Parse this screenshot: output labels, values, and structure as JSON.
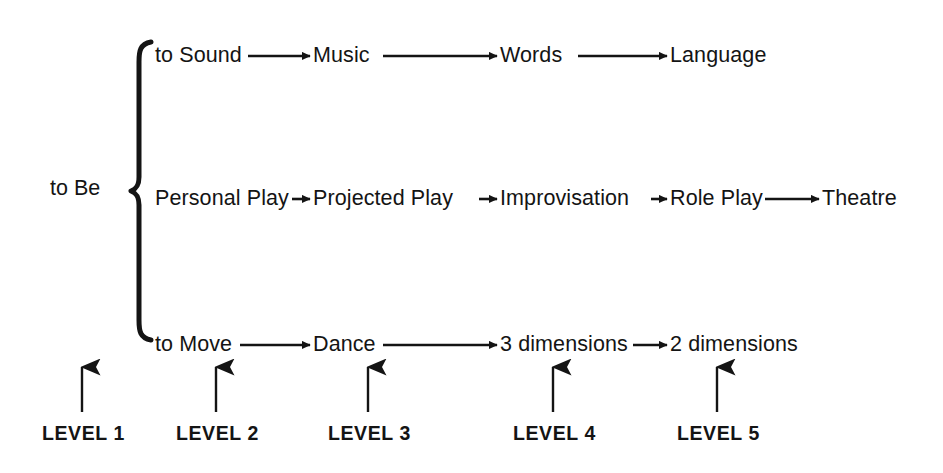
{
  "diagram": {
    "title": "to Be",
    "root": {
      "label": "to Be",
      "x": 50,
      "y": 178
    },
    "brace": {
      "name": "curly-brace",
      "top": 42,
      "bottom": 340,
      "x": 139
    },
    "rows": [
      {
        "name": "sound-branch",
        "y": 45,
        "nodes": [
          {
            "label": "to Sound",
            "x": 155,
            "level": 2
          },
          {
            "label": "Music",
            "x": 313,
            "level": 3
          },
          {
            "label": "Words",
            "x": 500,
            "level": 4
          },
          {
            "label": "Language",
            "x": 670,
            "level": 5
          }
        ],
        "connectors": [
          {
            "from": "to Sound",
            "to": "Music",
            "x1": 248,
            "x2": 310
          },
          {
            "from": "Music",
            "to": "Words",
            "x1": 383,
            "x2": 497
          },
          {
            "from": "Words",
            "to": "Language",
            "x1": 578,
            "x2": 667
          }
        ]
      },
      {
        "name": "play-branch",
        "y": 188,
        "nodes": [
          {
            "label": "Personal Play",
            "x": 155,
            "level": 2
          },
          {
            "label": "Projected Play",
            "x": 313,
            "level": 3
          },
          {
            "label": "Improvisation",
            "x": 500,
            "level": 4
          },
          {
            "label": "Role Play",
            "x": 670,
            "level": 5
          },
          {
            "label": "Theatre",
            "x": 822,
            "level": 6
          }
        ],
        "connectors": [
          {
            "from": "Personal Play",
            "to": "Projected Play",
            "x1": 292,
            "x2": 310
          },
          {
            "from": "Projected Play",
            "to": "Improvisation",
            "x1": 479,
            "x2": 497
          },
          {
            "from": "Improvisation",
            "to": "Role Play",
            "x1": 651,
            "x2": 667
          },
          {
            "from": "Role Play",
            "to": "Theatre",
            "x1": 765,
            "x2": 819
          }
        ]
      },
      {
        "name": "move-branch",
        "y": 334,
        "nodes": [
          {
            "label": "to Move",
            "x": 155,
            "level": 2
          },
          {
            "label": "Dance",
            "x": 313,
            "level": 3
          },
          {
            "label": "3 dimensions",
            "x": 500,
            "level": 4
          },
          {
            "label": "2 dimensions",
            "x": 670,
            "level": 5
          }
        ],
        "connectors": [
          {
            "from": "to Move",
            "to": "Dance",
            "x1": 240,
            "x2": 310
          },
          {
            "from": "Dance",
            "to": "3 dimensions",
            "x1": 383,
            "x2": 497
          },
          {
            "from": "3 dimensions",
            "to": "2 dimensions",
            "x1": 633,
            "x2": 667
          }
        ]
      }
    ],
    "levels": [
      {
        "label": "LEVEL 1",
        "label_x": 42,
        "arrow_x": 82
      },
      {
        "label": "LEVEL 2",
        "label_x": 176,
        "arrow_x": 216
      },
      {
        "label": "LEVEL 3",
        "label_x": 328,
        "arrow_x": 368
      },
      {
        "label": "LEVEL 4",
        "label_x": 513,
        "arrow_x": 553
      },
      {
        "label": "LEVEL 5",
        "label_x": 677,
        "arrow_x": 717
      }
    ],
    "level_label_y": 424,
    "level_arrow_top": 367,
    "level_arrow_bottom": 412,
    "colors": {
      "ink": "#141414",
      "background": "#ffffff"
    }
  }
}
